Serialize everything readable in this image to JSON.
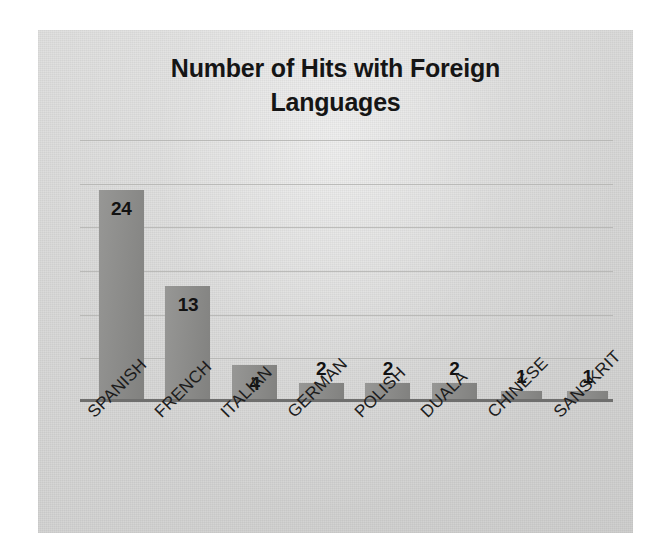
{
  "chart_data": {
    "type": "bar",
    "title": "Number of Hits with Foreign Languages",
    "title_line1": "Number of Hits with Foreign",
    "title_line2": "Languages",
    "categories": [
      "SPANISH",
      "FRENCH",
      "ITALIAN",
      "GERMAN",
      "POLISH",
      "DUALA",
      "CHINESE",
      "SANSKRIT"
    ],
    "values": [
      24,
      13,
      4,
      2,
      2,
      2,
      1,
      1
    ],
    "xlabel": "",
    "ylabel": "",
    "ylim": [
      0,
      30
    ],
    "y_tick_step": 5,
    "y_tick_labels_visible": false,
    "gridlines": [
      5,
      10,
      15,
      20,
      25,
      30
    ],
    "grid": true,
    "legend": false,
    "data_labels": [
      "24",
      "13",
      "4",
      "2",
      "2",
      "2",
      "1",
      "1"
    ],
    "colors": {
      "bar_fill": "#8b8b89",
      "panel_background": "#d9d9d8",
      "gridline": "#b4b4b2",
      "axis_line": "#6f6f6e",
      "title_text": "#151515",
      "label_text": "#1c1c1c",
      "value_text": "#121212",
      "outer_background": "#ffffff"
    }
  }
}
